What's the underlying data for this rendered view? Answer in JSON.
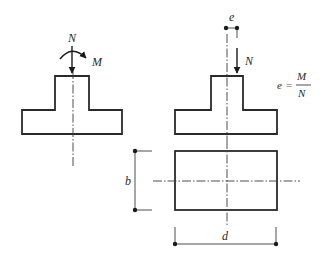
{
  "figure": {
    "left_section": {
      "axial_load_label": "N",
      "moment_label": "M"
    },
    "right_section": {
      "eccentricity_label": "e",
      "axial_load_label": "N",
      "formula": {
        "lhs": "e",
        "equals": "=",
        "numerator": "M",
        "denominator": "N"
      }
    },
    "plan_view": {
      "width_dimension_label": "b",
      "depth_dimension_label": "d"
    }
  },
  "colors": {
    "line": "#2a2a2a",
    "background": "#ffffff"
  }
}
